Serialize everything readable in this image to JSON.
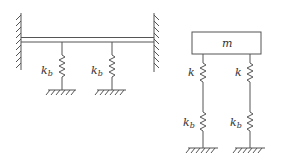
{
  "diagram": {
    "left_system": {
      "description": "Beam clamped between two walls, supported by two springs to ground",
      "springs": [
        {
          "label_main": "k",
          "label_sub": "b"
        },
        {
          "label_main": "k",
          "label_sub": "b"
        }
      ]
    },
    "right_system": {
      "mass_label": "m",
      "columns": [
        {
          "upper": {
            "label_main": "k",
            "label_sub": ""
          },
          "lower": {
            "label_main": "k",
            "label_sub": "b"
          }
        },
        {
          "upper": {
            "label_main": "k",
            "label_sub": ""
          },
          "lower": {
            "label_main": "k",
            "label_sub": "b"
          }
        }
      ]
    },
    "colors": {
      "line": "#555555",
      "text": "#333333",
      "background": "#ffffff"
    }
  }
}
